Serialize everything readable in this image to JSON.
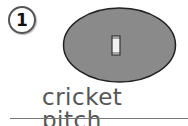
{
  "item_number": "1",
  "caption": "cricket pitch",
  "colors": {
    "field_fill": "#8a8a8a",
    "field_outline": "#222222",
    "pitch_fill": "#f2f2f2",
    "text": "#555555"
  }
}
